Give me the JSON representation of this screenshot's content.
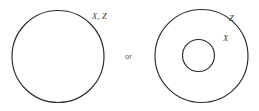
{
  "figure": {
    "background_color": "#ffffff",
    "stroke_color": "#2b2b2b",
    "label_color": "#3a3a3a",
    "connector_color": "#5a5a5a",
    "connector": {
      "text": "or"
    },
    "left_diagram": {
      "name": "coincident-sets",
      "label": "X, Z",
      "circle": {
        "cx": 58,
        "cy": 56.5,
        "r": 46
      }
    },
    "right_diagram": {
      "name": "nested-sets",
      "outer_label": "Z",
      "inner_label": "X",
      "outer_circle": {
        "cx": 201.5,
        "cy": 56,
        "r": 46.5
      },
      "inner_circle": {
        "cx": 198.5,
        "cy": 55.5,
        "r": 16
      }
    }
  }
}
